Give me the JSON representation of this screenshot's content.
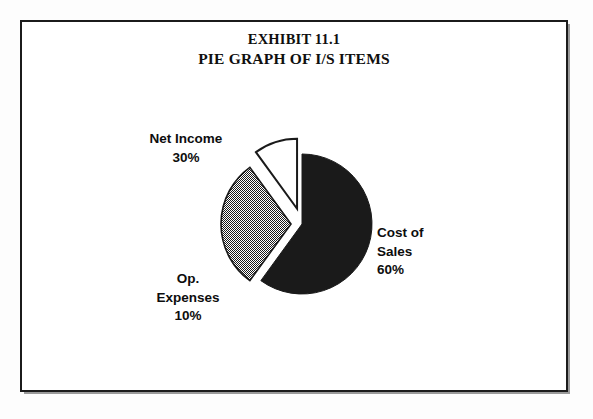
{
  "exhibit": {
    "title_line_1": "EXHIBIT 11.1",
    "title_line_2": "PIE GRAPH OF I/S ITEMS"
  },
  "labels": {
    "net_income": "Net Income\n30%",
    "cost_of_sales": "Cost of\nSales\n60%",
    "op_expenses": "Op.\nExpenses\n10%"
  },
  "chart_data": {
    "type": "pie",
    "categories": [
      "Cost of Sales",
      "Net Income",
      "Op. Expenses"
    ],
    "values": [
      60,
      30,
      10
    ],
    "unit": "%",
    "total": 100,
    "start_angle_deg": 0,
    "direction": "clockwise",
    "legend": "none",
    "grid": false,
    "slices": [
      {
        "name": "Cost of Sales",
        "label_lines": [
          "Cost of",
          "Sales",
          "60%"
        ],
        "value": 60,
        "percent": "60%",
        "start_deg": 0,
        "end_deg": 216,
        "fill_style": "solid-black",
        "fill_color": "#1a1a1a",
        "stroke_color": "#1a1a1a",
        "exploded": false,
        "explode_px": 0,
        "label_position": "right"
      },
      {
        "name": "Net Income",
        "label_lines": [
          "Net Income",
          "30%"
        ],
        "value": 30,
        "percent": "30%",
        "start_deg": 216,
        "end_deg": 324,
        "fill_style": "checkerboard-dither-50",
        "fill_color": "#8c8c8c",
        "stroke_color": "#1a1a1a",
        "exploded": true,
        "explode_px": 11,
        "label_position": "upper-left"
      },
      {
        "name": "Op. Expenses",
        "label_lines": [
          "Op.",
          "Expenses",
          "10%"
        ],
        "value": 10,
        "percent": "10%",
        "start_deg": 324,
        "end_deg": 360,
        "fill_style": "white-outline",
        "fill_color": "#ffffff",
        "stroke_color": "#1a1a1a",
        "exploded": true,
        "explode_px": 16,
        "label_position": "lower-left"
      }
    ],
    "geometry": {
      "center_x": 280,
      "center_y": 202,
      "radius": 70
    }
  },
  "colors": {
    "ink": "#1a1a1a",
    "frame": "#1b1b1b",
    "frame_shadow": "#9a9a9a",
    "paper": "#ffffff",
    "page": "#fdfdfd"
  }
}
